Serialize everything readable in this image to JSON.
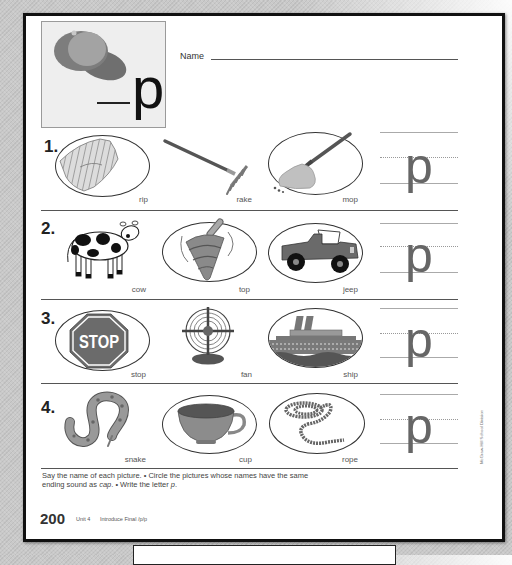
{
  "header": {
    "name_label": "Name",
    "picture_word": "cap",
    "picture_icon": "cap-icon",
    "target_letter": "p"
  },
  "rows": [
    {
      "number": "1.",
      "letter": "p",
      "items": [
        {
          "word": "rip",
          "icon": "torn-cloth-icon",
          "circled": true
        },
        {
          "word": "rake",
          "icon": "rake-icon",
          "circled": false
        },
        {
          "word": "mop",
          "icon": "mop-icon",
          "circled": true
        }
      ]
    },
    {
      "number": "2.",
      "letter": "p",
      "items": [
        {
          "word": "cow",
          "icon": "cow-icon",
          "circled": false
        },
        {
          "word": "top",
          "icon": "spinning-top-icon",
          "circled": true
        },
        {
          "word": "jeep",
          "icon": "jeep-icon",
          "circled": true
        }
      ]
    },
    {
      "number": "3.",
      "letter": "p",
      "items": [
        {
          "word": "stop",
          "icon": "stop-sign-icon",
          "circled": true,
          "sign_text": "STOP"
        },
        {
          "word": "fan",
          "icon": "fan-icon",
          "circled": false
        },
        {
          "word": "ship",
          "icon": "ship-icon",
          "circled": true
        }
      ]
    },
    {
      "number": "4.",
      "letter": "p",
      "items": [
        {
          "word": "snake",
          "icon": "snake-icon",
          "circled": false
        },
        {
          "word": "cup",
          "icon": "cup-icon",
          "circled": true
        },
        {
          "word": "rope",
          "icon": "rope-icon",
          "circled": true
        }
      ]
    }
  ],
  "instructions": {
    "line1": "Say the name of each picture. • Circle the pictures whose names have the same",
    "line2_a": "ending sound as ",
    "line2_word": "cap",
    "line2_b": ". • Write the letter ",
    "line2_letter": "p",
    "line2_c": "."
  },
  "footer": {
    "page_number": "200",
    "unit": "Unit 4",
    "lesson": "Introduce Final /p/p"
  },
  "credit": "McGraw-Hill School Division",
  "colors": {
    "ink": "#222222",
    "picture_gray": "#8a8a8a",
    "page": "#ffffff",
    "background": "#c9c9c9"
  }
}
